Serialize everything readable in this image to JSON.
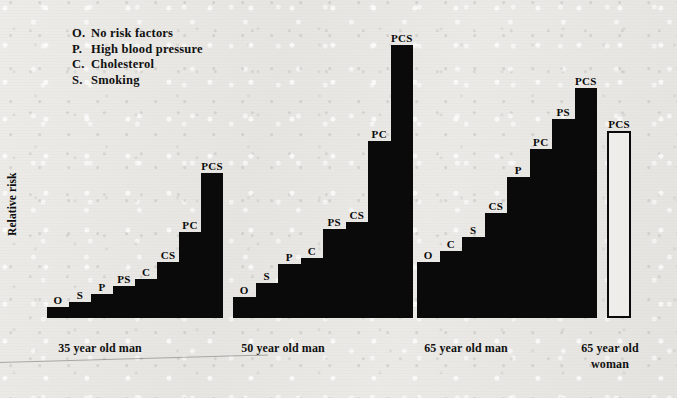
{
  "figure": {
    "ylabel": "Relative risk",
    "legend_title": "",
    "legend": [
      {
        "key": "O.",
        "desc": "No risk factors"
      },
      {
        "key": "P.",
        "desc": "High blood pressure"
      },
      {
        "key": "C.",
        "desc": "Cholesterol"
      },
      {
        "key": "S.",
        "desc": "Smoking"
      }
    ]
  },
  "chart_data": {
    "type": "bar",
    "title": "",
    "xlabel": "",
    "ylabel": "Relative risk",
    "grid": false,
    "legend_position": "top-left",
    "ylim": [
      0,
      30
    ],
    "axis_note": "Relative risk axis is unlabelled (no tick values printed)",
    "groups": [
      {
        "name": "35 year old man",
        "style": "filled",
        "categories": [
          "O",
          "S",
          "P",
          "PS",
          "C",
          "CS",
          "PC",
          "PCS"
        ],
        "values": [
          1.0,
          1.5,
          2.2,
          3.0,
          3.6,
          5.2,
          8.0,
          13.5
        ]
      },
      {
        "name": "50 year old man",
        "style": "filled",
        "categories": [
          "O",
          "S",
          "P",
          "C",
          "PS",
          "CS",
          "PC",
          "PCS"
        ],
        "values": [
          2.0,
          3.3,
          5.0,
          5.6,
          8.3,
          9.0,
          16.5,
          25.5
        ]
      },
      {
        "name": "65 year old man",
        "style": "filled",
        "categories": [
          "O",
          "C",
          "S",
          "CS",
          "P",
          "PC",
          "PS",
          "PCS"
        ],
        "values": [
          5.2,
          6.3,
          7.6,
          9.8,
          13.2,
          15.8,
          18.6,
          21.5
        ]
      },
      {
        "name": "65 year old woman",
        "style": "outlined",
        "categories": [
          "PCS"
        ],
        "values": [
          17.5
        ]
      }
    ]
  },
  "xaxis": {
    "captions": [
      "35 year old man",
      "50 year old man",
      "65 year old man",
      "65 year old\nwoman"
    ]
  }
}
